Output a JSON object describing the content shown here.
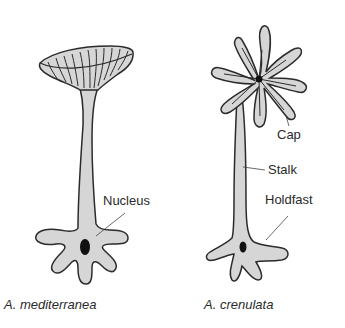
{
  "diagram": {
    "type": "biological-illustration",
    "colors": {
      "fill": "#d6d6d6",
      "outline": "#2b2b2b",
      "nucleus": "#111111",
      "text": "#2a2a2a"
    },
    "organisms": [
      {
        "species_label": "A. mediterranea",
        "cap_shape": "umbrella-cup with radial ribs"
      },
      {
        "species_label": "A. crenulata",
        "cap_shape": "star with lobed rays"
      }
    ],
    "labels": {
      "nucleus": "Nucleus",
      "cap": "Cap",
      "stalk": "Stalk",
      "holdfast": "Holdfast"
    }
  }
}
